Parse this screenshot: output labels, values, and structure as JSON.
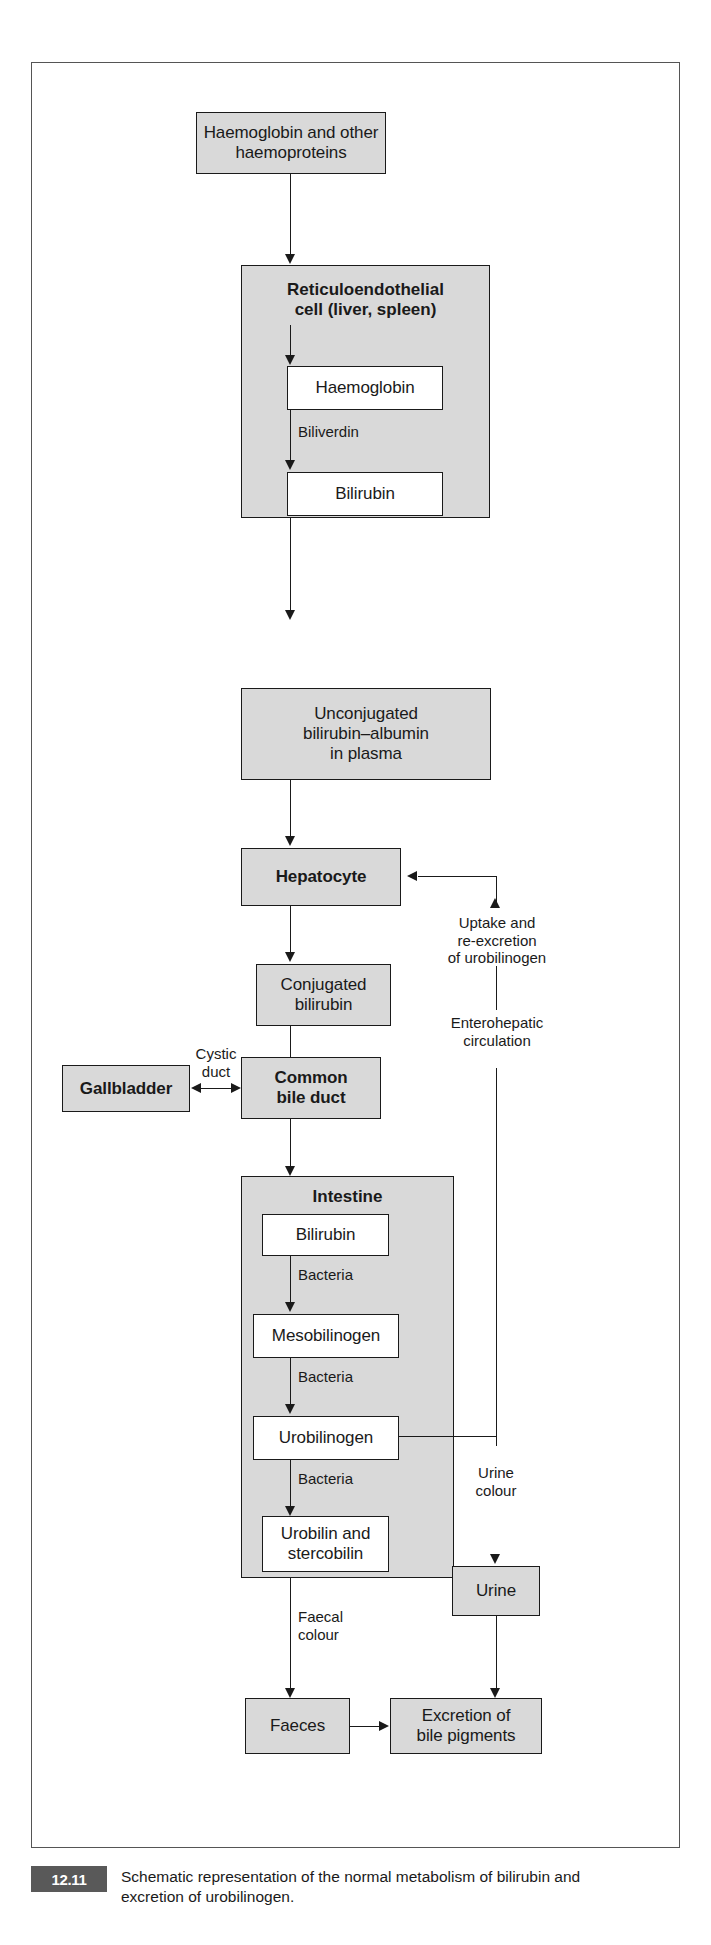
{
  "figure": {
    "number": "12.11",
    "caption": "Schematic representation of the normal metabolism of bilirubin and excretion of urobilinogen."
  },
  "nodes": {
    "haemoglobin_source": "Haemoglobin and\nother haemoproteins",
    "reticuloendothelial_title": "Reticuloendothelial\ncell (liver, spleen)",
    "haemoglobin": "Haemoglobin",
    "bilirubin_re": "Bilirubin",
    "unconjugated": "Unconjugated\nbilirubin–albumin\nin plasma",
    "hepatocyte": "Hepatocyte",
    "conjugated": "Conjugated\nbilirubin",
    "gallbladder": "Gallbladder",
    "common_bile_duct": "Common\nbile duct",
    "intestine_title": "Intestine",
    "bilirubin_gut": "Bilirubin",
    "mesobilinogen": "Mesobilinogen",
    "urobilinogen": "Urobilinogen",
    "urobilin_stercobilin": "Urobilin and\nstercobilin",
    "urine": "Urine",
    "faeces": "Faeces",
    "excretion": "Excretion of\nbile pigments"
  },
  "edge_labels": {
    "biliverdin": "Biliverdin",
    "bacteria_1": "Bacteria",
    "bacteria_2": "Bacteria",
    "bacteria_3": "Bacteria",
    "cystic_duct": "Cystic\nduct",
    "uptake_reexcretion": "Uptake and\nre-excretion\nof urobilinogen",
    "enterohepatic": "Enterohepatic\ncirculation",
    "urine_colour": "Urine\ncolour",
    "faecal_colour": "Faecal\ncolour"
  },
  "colors": {
    "box_fill": "#d9d9d9",
    "box_white": "#ffffff",
    "stroke": "#1a1a1a",
    "frame": "#555555",
    "badge_bg": "#595959",
    "badge_text": "#ffffff"
  }
}
